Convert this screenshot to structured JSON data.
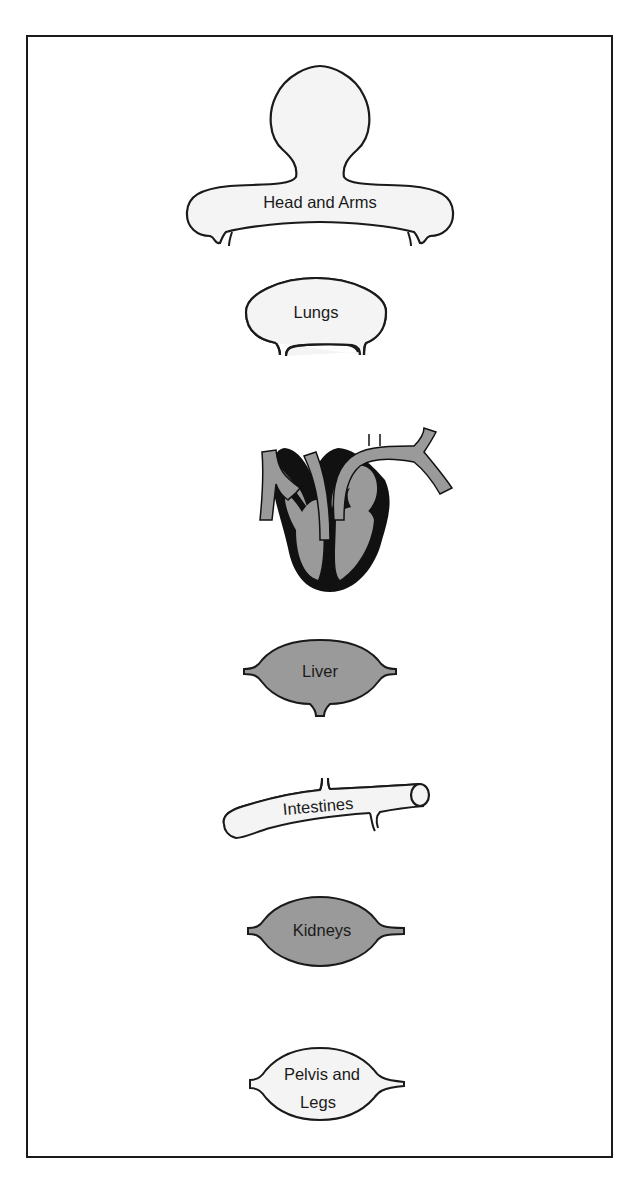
{
  "diagram": {
    "type": "circulatory-system-schematic",
    "colors": {
      "outline": "#1a1a1a",
      "light_fill": "#f4f4f4",
      "shaded_fill": "#9a9a9a",
      "heart_dark": "#111111",
      "frame": "#1a1a1a"
    },
    "organs": [
      {
        "id": "head-and-arms",
        "label": "Head and Arms",
        "fill": "light"
      },
      {
        "id": "lungs",
        "label": "Lungs",
        "fill": "light"
      },
      {
        "id": "heart",
        "label": "",
        "fill": "shaded"
      },
      {
        "id": "liver",
        "label": "Liver",
        "fill": "shaded"
      },
      {
        "id": "intestines",
        "label": "Intestines",
        "fill": "light"
      },
      {
        "id": "kidneys",
        "label": "Kidneys",
        "fill": "shaded"
      },
      {
        "id": "pelvis-and-legs",
        "label_line1": "Pelvis and",
        "label_line2": "Legs",
        "fill": "light"
      }
    ]
  }
}
